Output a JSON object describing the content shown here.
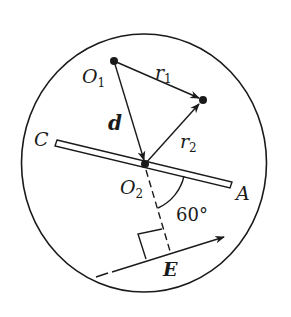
{
  "labels": {
    "O1": "O",
    "O1_sub": "1",
    "O2": "O",
    "O2_sub": "2",
    "r1": "r",
    "r1_sub": "1",
    "r2": "r",
    "r2_sub": "2",
    "d": "d",
    "C": "C",
    "A": "A",
    "E": "E",
    "angle": "60°"
  },
  "colors": {
    "ink": "#1a1a1a",
    "background": "#ffffff"
  }
}
